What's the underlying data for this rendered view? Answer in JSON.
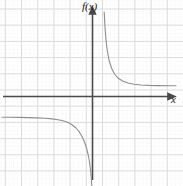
{
  "figure": {
    "width": 183,
    "height": 186,
    "background": "#ffffff"
  },
  "labels": {
    "y_axis": "f(x)",
    "x_axis": "x"
  },
  "colors": {
    "axis": "#4a4a4a",
    "curve": "#8a8a8a",
    "grid_major": "#d8d8d8",
    "grid_minor": "#e6e6e6",
    "background": "#ffffff"
  },
  "grid": {
    "major_spacing_px": 16.2,
    "minor_per_major": 4,
    "major_x_positions": [
      5.3,
      21.5,
      37.7,
      53.9,
      70.1,
      86.3,
      102.5,
      118.7,
      134.9,
      151.1,
      167.3
    ],
    "major_y_positions": [
      9.0,
      25.2,
      41.4,
      57.6,
      73.8,
      90.0,
      106.2,
      122.4,
      138.6,
      154.8,
      170.9
    ],
    "show_minor": true,
    "show_major": true
  },
  "axes": {
    "x_axis_y_px": 96.5,
    "y_axis_x_px": 92.5,
    "x_axis_start_px": 3,
    "x_axis_end_px": 168,
    "y_axis_start_px": 180,
    "y_axis_end_px": 14,
    "arrowheads": [
      "x-positive",
      "y-positive"
    ]
  },
  "chart_data": {
    "type": "line",
    "title": "",
    "xlabel": "x",
    "ylabel": "f(x)",
    "grid": true,
    "legend": null,
    "function_family": "rational / reciprocal with vertical and horizontal asymptotes",
    "asymptotes": {
      "vertical_x_px": 103.5,
      "horizontal_right_branch_y_px": 85.5,
      "horizontal_left_branch_y_px": 117.5
    },
    "branches": [
      {
        "name": "right-branch",
        "description": "decreasing from +infinity near the vertical asymptote, flattening toward a horizontal asymptote above the x-axis",
        "points_px": [
          [
            104.2,
            12.0
          ],
          [
            104.6,
            20.0
          ],
          [
            105.2,
            30.0
          ],
          [
            106.0,
            40.0
          ],
          [
            107.2,
            50.0
          ],
          [
            109.0,
            60.0
          ],
          [
            111.5,
            68.0
          ],
          [
            114.5,
            74.0
          ],
          [
            118.0,
            78.0
          ],
          [
            122.5,
            81.0
          ],
          [
            128.0,
            83.0
          ],
          [
            134.0,
            84.2
          ],
          [
            141.0,
            85.0
          ],
          [
            149.0,
            85.4
          ],
          [
            158.0,
            85.6
          ],
          [
            168.0,
            85.7
          ],
          [
            176.0,
            85.8
          ]
        ]
      },
      {
        "name": "left-branch",
        "description": "nearly flat along a horizontal asymptote below the x-axis on the far left, then plunging to -infinity just left of the vertical asymptote",
        "points_px": [
          [
            2.0,
            117.2
          ],
          [
            10.0,
            117.3
          ],
          [
            19.0,
            117.4
          ],
          [
            28.0,
            117.6
          ],
          [
            37.0,
            117.9
          ],
          [
            45.0,
            118.3
          ],
          [
            52.0,
            118.9
          ],
          [
            58.0,
            119.7
          ],
          [
            63.0,
            120.8
          ],
          [
            68.0,
            122.6
          ],
          [
            72.0,
            124.8
          ],
          [
            76.0,
            128.0
          ],
          [
            79.0,
            131.5
          ],
          [
            82.0,
            136.5
          ],
          [
            84.5,
            142.0
          ],
          [
            86.5,
            148.0
          ],
          [
            88.0,
            154.0
          ],
          [
            89.2,
            160.0
          ],
          [
            90.2,
            167.0
          ],
          [
            91.0,
            174.0
          ],
          [
            91.6,
            182.0
          ],
          [
            91.9,
            188.0
          ]
        ]
      }
    ]
  }
}
